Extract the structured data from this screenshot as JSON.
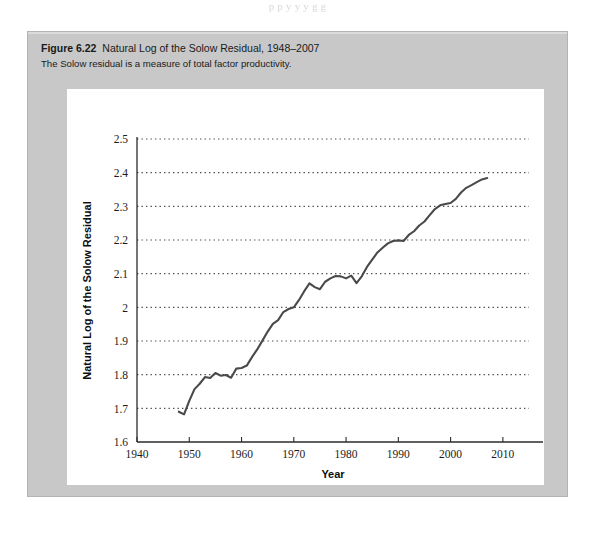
{
  "page": {
    "top_text_fragment": "p    p            y        y          y   g           g"
  },
  "figure": {
    "label": "Figure 6.22",
    "title": "Natural Log of the Solow Residual, 1948–2007",
    "subtitle": "The Solow residual is a measure of total factor productivity."
  },
  "chart_data": {
    "type": "line",
    "title": "Natural Log of the Solow Residual, 1948–2007",
    "xlabel": "Year",
    "ylabel": "Natural Log of the Solow Residual",
    "xlim": [
      1940,
      2015
    ],
    "ylim": [
      1.6,
      2.5
    ],
    "xticks": [
      1940,
      1950,
      1960,
      1970,
      1980,
      1990,
      2000,
      2010
    ],
    "yticks": [
      "1.6",
      "1.7",
      "1.8",
      "1.9",
      "2",
      "2.1",
      "2.2",
      "2.3",
      "2.4",
      "2.5"
    ],
    "ytick_values": [
      1.6,
      1.7,
      1.8,
      1.9,
      2.0,
      2.1,
      2.2,
      2.3,
      2.4,
      2.5
    ],
    "grid": "horizontal-dotted",
    "legend": "none",
    "line_color": "#4a4a4a",
    "series": [
      {
        "name": "Natural Log of the Solow Residual",
        "x": [
          1948,
          1949,
          1950,
          1951,
          1952,
          1953,
          1954,
          1955,
          1956,
          1957,
          1958,
          1959,
          1960,
          1961,
          1962,
          1963,
          1964,
          1965,
          1966,
          1967,
          1968,
          1969,
          1970,
          1971,
          1972,
          1973,
          1974,
          1975,
          1976,
          1977,
          1978,
          1979,
          1980,
          1981,
          1982,
          1983,
          1984,
          1985,
          1986,
          1987,
          1988,
          1989,
          1990,
          1991,
          1992,
          1993,
          1994,
          1995,
          1996,
          1997,
          1998,
          1999,
          2000,
          2001,
          2002,
          2003,
          2004,
          2005,
          2006,
          2007
        ],
        "values": [
          1.69,
          1.682,
          1.722,
          1.757,
          1.773,
          1.793,
          1.79,
          1.805,
          1.797,
          1.799,
          1.791,
          1.818,
          1.82,
          1.827,
          1.852,
          1.875,
          1.901,
          1.928,
          1.951,
          1.962,
          1.986,
          1.995,
          2.0,
          2.022,
          2.048,
          2.071,
          2.06,
          2.054,
          2.076,
          2.086,
          2.093,
          2.092,
          2.086,
          2.094,
          2.072,
          2.092,
          2.12,
          2.142,
          2.163,
          2.177,
          2.19,
          2.197,
          2.199,
          2.197,
          2.215,
          2.226,
          2.243,
          2.255,
          2.274,
          2.292,
          2.303,
          2.307,
          2.31,
          2.322,
          2.341,
          2.355,
          2.363,
          2.372,
          2.38,
          2.384
        ]
      }
    ]
  }
}
